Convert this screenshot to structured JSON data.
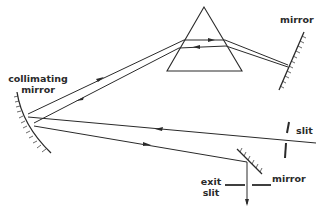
{
  "diagram": {
    "type": "optical-path",
    "colors": {
      "line": "#2a2a2a",
      "background": "#ffffff"
    },
    "labels": {
      "collimating_mirror_line1": "collimating",
      "collimating_mirror_line2": "mirror",
      "top_mirror": "mirror",
      "entrance_slit": "slit",
      "small_mirror": "mirror",
      "exit_slit_line1": "exit",
      "exit_slit_line2": "slit"
    },
    "components": [
      "prism",
      "mirror",
      "collimating mirror",
      "slit",
      "mirror",
      "exit slit"
    ]
  }
}
